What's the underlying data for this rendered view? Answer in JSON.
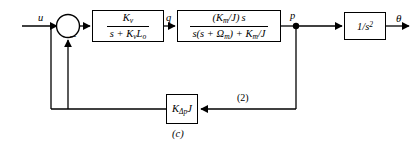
{
  "diagram": {
    "caption": "(c)",
    "summing_junction": {
      "name": "summing-junction",
      "sign_negative": "−"
    },
    "signals": {
      "input": "u",
      "node_q": "q",
      "node_p": "p",
      "output": "θ",
      "branch_marker": "(2)"
    },
    "blocks": [
      {
        "id": "gain-q",
        "type": "transfer-function",
        "numerator": "Kᵥ",
        "denominator": "s + KᵥLₒ",
        "numerator_parts": {
          "base": "K",
          "sub": "v"
        },
        "denominator_parts": "s + K_v L_o"
      },
      {
        "id": "plant-p",
        "type": "transfer-function",
        "numerator": "(Kₘ/J) s",
        "denominator": "s(s + Ωₘ) + Kₘ/J"
      },
      {
        "id": "integrator",
        "type": "transfer-function",
        "label": "1/s²"
      },
      {
        "id": "feedback-gain",
        "type": "gain",
        "label": "KΔₚJ"
      }
    ]
  },
  "colors": {
    "line": "#000000",
    "background": "#ffffff"
  }
}
